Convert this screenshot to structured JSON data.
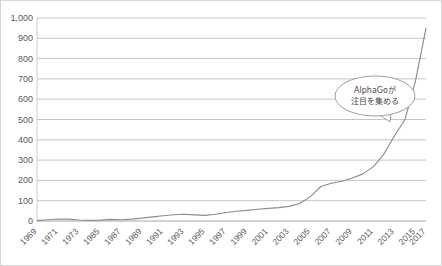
{
  "chart_data": {
    "type": "line",
    "title": "",
    "subtitle": "",
    "xlabel": "",
    "ylabel": "",
    "ylim": [
      0,
      1000
    ],
    "ytick_step": 100,
    "grid": true,
    "legend": "none",
    "line_color": "#8c8c8c",
    "grid_color": "#b6b6b6",
    "categories": [
      "1969",
      "1970",
      "1971",
      "1972",
      "1973",
      "1985",
      "1986",
      "1987",
      "1988",
      "1989",
      "1990",
      "1991",
      "1992",
      "1993",
      "1994",
      "1995",
      "1996",
      "1997",
      "1998",
      "1999",
      "2000",
      "2001",
      "2002",
      "2003",
      "2004",
      "2005",
      "2006",
      "2007",
      "2008",
      "2009",
      "2010",
      "2011",
      "2012",
      "2013",
      "2014",
      "2015",
      "2016",
      "2017"
    ],
    "tick_labels": [
      "1969",
      "1971",
      "1973",
      "1985",
      "1987",
      "1989",
      "1991",
      "1993",
      "1995",
      "1997",
      "1999",
      "2001",
      "2003",
      "2005",
      "2007",
      "2009",
      "2011",
      "2013",
      "2015",
      "2017"
    ],
    "values": [
      2,
      6,
      10,
      9,
      5,
      3,
      4,
      8,
      6,
      9,
      14,
      20,
      26,
      31,
      33,
      30,
      28,
      33,
      42,
      48,
      52,
      58,
      62,
      66,
      72,
      86,
      120,
      170,
      186,
      196,
      212,
      232,
      268,
      330,
      420,
      500,
      690,
      950
    ],
    "series": [
      {
        "name": "AI関連件数",
        "values": [
          2,
          6,
          10,
          9,
          5,
          3,
          4,
          8,
          6,
          9,
          14,
          20,
          26,
          31,
          33,
          30,
          28,
          33,
          42,
          48,
          52,
          58,
          62,
          66,
          72,
          86,
          120,
          170,
          186,
          196,
          212,
          232,
          268,
          330,
          420,
          500,
          690,
          950
        ]
      }
    ],
    "ytick_labels": [
      "0",
      "100",
      "200",
      "300",
      "400",
      "500",
      "600",
      "700",
      "800",
      "900",
      "1,000"
    ],
    "annotations": [
      {
        "id": "alphago-callout",
        "line1": "AlphaGoが",
        "line2": "注目を集める",
        "points_to_year": "2015",
        "points_to_value": 500
      }
    ]
  }
}
